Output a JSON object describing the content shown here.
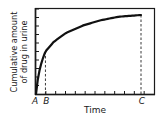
{
  "chart_data": {
    "type": "line",
    "title": "",
    "xlabel": "Time",
    "ylabel_line1": "Cumulative amount",
    "ylabel_line2": "of drug in urine",
    "x_markers": [
      {
        "label": "A",
        "x": 0
      },
      {
        "label": "B",
        "x": 0.08
      },
      {
        "label": "C",
        "x": 0.89
      }
    ],
    "series": [
      {
        "name": "Cumulative amount of drug in urine",
        "description": "Rises steeply from A, concave down, approaching a plateau at C",
        "x": [
          0,
          0.02,
          0.05,
          0.08,
          0.15,
          0.25,
          0.4,
          0.55,
          0.7,
          0.89
        ],
        "y": [
          0,
          0.22,
          0.38,
          0.49,
          0.6,
          0.7,
          0.79,
          0.85,
          0.89,
          0.91
        ]
      }
    ],
    "xlim": [
      0,
      1
    ],
    "ylim": [
      0,
      1
    ],
    "x_ticks_count": 12,
    "y_ticks_count": 10,
    "grid": false,
    "legend": "none",
    "frame": "box"
  }
}
